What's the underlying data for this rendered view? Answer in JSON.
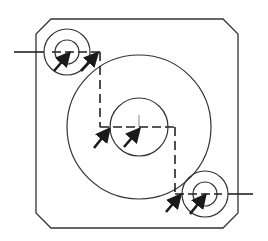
{
  "drawing": {
    "type": "technical-section-view",
    "stroke_color": "#333333",
    "arrow_color": "#1a1a1a",
    "background": "#ffffff",
    "plate": {
      "left": 36,
      "top": 19,
      "right": 238,
      "bottom": 228,
      "chamfer": 15
    },
    "center_feature": {
      "cx": 139,
      "cy": 127,
      "outer_r": 72,
      "inner_r": 29
    },
    "holes": [
      {
        "name": "top-left-hole",
        "cx": 67,
        "cy": 52,
        "outer_r": 23,
        "inner_r": 12
      },
      {
        "name": "bottom-right-hole",
        "cx": 205,
        "cy": 194,
        "outer_r": 23,
        "inner_r": 12
      }
    ],
    "section_line": [
      [
        14,
        52
      ],
      [
        100,
        52
      ],
      [
        100,
        127
      ],
      [
        175,
        127
      ],
      [
        175,
        194
      ],
      [
        253,
        194
      ]
    ],
    "arrows_count": 6
  }
}
